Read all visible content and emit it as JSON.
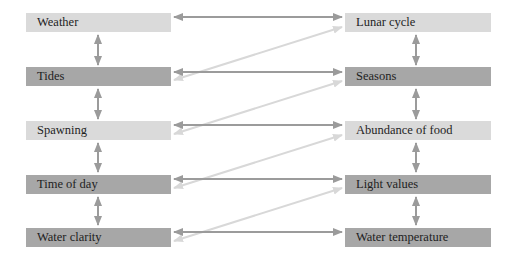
{
  "colors": {
    "box_light": "#dadada",
    "box_dark": "#a7a7a7",
    "arrow_dark": "#9b9b9b",
    "arrow_light": "#d8d8d8",
    "text": "#1e1e1e"
  },
  "left_column": [
    {
      "label": "Weather",
      "shade": "light"
    },
    {
      "label": "Tides",
      "shade": "dark"
    },
    {
      "label": "Spawning",
      "shade": "light"
    },
    {
      "label": "Time of day",
      "shade": "dark"
    },
    {
      "label": "Water clarity",
      "shade": "dark"
    }
  ],
  "right_column": [
    {
      "label": "Lunar cycle",
      "shade": "light"
    },
    {
      "label": "Seasons",
      "shade": "dark"
    },
    {
      "label": "Abundance of food",
      "shade": "light"
    },
    {
      "label": "Light values",
      "shade": "dark"
    },
    {
      "label": "Water temperature",
      "shade": "dark"
    }
  ],
  "connections": {
    "horizontal": [
      [
        "Weather",
        "Lunar cycle"
      ],
      [
        "Tides",
        "Seasons"
      ],
      [
        "Spawning",
        "Abundance of food"
      ],
      [
        "Time of day",
        "Light values"
      ],
      [
        "Water clarity",
        "Water temperature"
      ]
    ],
    "diagonal": [
      [
        "Tides",
        "Lunar cycle"
      ],
      [
        "Spawning",
        "Seasons"
      ],
      [
        "Time of day",
        "Abundance of food"
      ],
      [
        "Water clarity",
        "Light values"
      ]
    ],
    "vertical_left": [
      [
        "Weather",
        "Tides"
      ],
      [
        "Tides",
        "Spawning"
      ],
      [
        "Spawning",
        "Time of day"
      ],
      [
        "Time of day",
        "Water clarity"
      ]
    ],
    "vertical_right": [
      [
        "Lunar cycle",
        "Seasons"
      ],
      [
        "Seasons",
        "Abundance of food"
      ],
      [
        "Abundance of food",
        "Light values"
      ],
      [
        "Light values",
        "Water temperature"
      ]
    ]
  }
}
